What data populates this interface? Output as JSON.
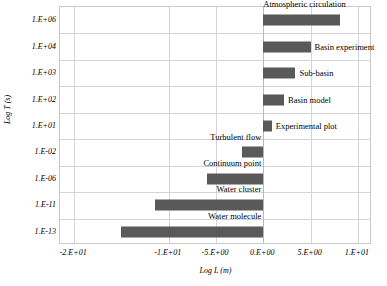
{
  "chart_data": {
    "type": "bar",
    "orientation": "horizontal",
    "title": "",
    "xlabel": "Log L (m)",
    "ylabel": "Log T (s)",
    "xlim": [
      -21.5,
      11.5
    ],
    "xticks": [
      -20,
      -10,
      -5,
      0,
      5,
      10
    ],
    "xticklabels": [
      "-2.E+01",
      "-1.E+01",
      "-5.E+00",
      "0.E+00",
      "5.E+00",
      "1.E+01"
    ],
    "yticklabels": [
      "1.E+06",
      "1.E+04",
      "1.E+03",
      "1.E+02",
      "1.E+01",
      "1.E-02",
      "1.E-06",
      "1.E-11",
      "1.E-13"
    ],
    "grid": true,
    "legend": "none",
    "bar_color": "#595959",
    "categories": [
      "Atmospheric circulation",
      "Basin experiment",
      "Sub-basin",
      "Basin model",
      "Experimental plot",
      "Turbulent flow",
      "Continuum point",
      "Water cluster",
      "Water molecule"
    ],
    "bars": [
      {
        "label": "Atmospheric circulation",
        "ytick": "1.E+06",
        "x_start": 0.0,
        "x_end": 8.1,
        "label_position": "above"
      },
      {
        "label": "Basin experiment",
        "ytick": "1.E+04",
        "x_start": 0.0,
        "x_end": 5.0,
        "label_position": "right"
      },
      {
        "label": "Sub-basin",
        "ytick": "1.E+03",
        "x_start": 0.0,
        "x_end": 3.4,
        "label_position": "right"
      },
      {
        "label": "Basin model",
        "ytick": "1.E+02",
        "x_start": 0.0,
        "x_end": 2.2,
        "label_position": "right"
      },
      {
        "label": "Experimental plot",
        "ytick": "1.E+01",
        "x_start": 0.0,
        "x_end": 0.9,
        "label_position": "right"
      },
      {
        "label": "Turbulent flow",
        "ytick": "1.E-02",
        "x_start": -2.2,
        "x_end": 0.0,
        "label_position": "above"
      },
      {
        "label": "Continuum point",
        "ytick": "1.E-06",
        "x_start": -6.0,
        "x_end": 0.0,
        "label_position": "above"
      },
      {
        "label": "Water cluster",
        "ytick": "1.E-11",
        "x_start": -11.5,
        "x_end": 0.0,
        "label_position": "above"
      },
      {
        "label": "Water molecule",
        "ytick": "1.E-13",
        "x_start": -15.0,
        "x_end": 0.0,
        "label_position": "above"
      }
    ]
  }
}
